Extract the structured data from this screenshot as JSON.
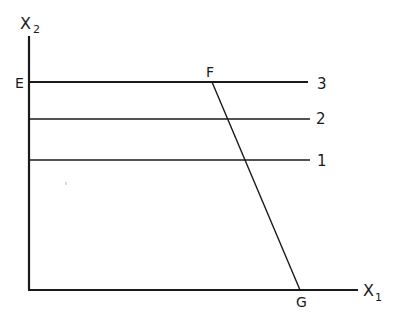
{
  "diagram": {
    "axes": {
      "y_label": "X",
      "y_sub": "2",
      "x_label": "X",
      "x_sub": "1"
    },
    "points": {
      "E": "E",
      "F": "F",
      "G": "G"
    },
    "lines": [
      {
        "label": "3",
        "y": 82
      },
      {
        "label": "2",
        "y": 119
      },
      {
        "label": "1",
        "y": 160
      }
    ],
    "segment": {
      "from": "F",
      "to": "G"
    },
    "colors": {
      "ink": "#1a1a1a",
      "background": "#ffffff"
    }
  }
}
